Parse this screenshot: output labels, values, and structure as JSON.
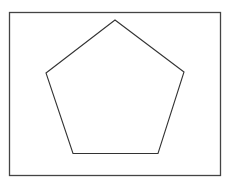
{
  "diagram": {
    "type": "geometric-figure",
    "shape": "regular-pentagon",
    "frame": {
      "x": 9.5,
      "y": 12.5,
      "width": 211,
      "height": 163,
      "stroke": "#444444",
      "stroke_width": 1.3
    },
    "pentagon": {
      "vertices": [
        [
          115,
          20
        ],
        [
          184,
          72
        ],
        [
          158,
          153.5
        ],
        [
          73,
          153.5
        ],
        [
          46,
          73
        ]
      ],
      "stroke": "#333333",
      "stroke_width": 1.1,
      "fill": "none"
    },
    "background": "#ffffff"
  }
}
